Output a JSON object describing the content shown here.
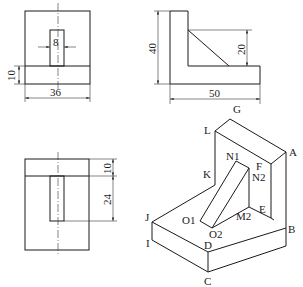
{
  "figure": {
    "front_view": {
      "dims": {
        "width": "36",
        "base_height": "10",
        "slot_width": "8"
      }
    },
    "side_view": {
      "dims": {
        "height": "40",
        "length": "50",
        "rib_height": "20"
      }
    },
    "top_view": {
      "dims": {
        "back_thickness": "10",
        "slot_length": "24"
      }
    },
    "isometric_view": {
      "vertex_labels": {
        "G": "G",
        "L": "L",
        "A": "A",
        "K": "K",
        "N1": "N1",
        "F": "F",
        "N2": "N2",
        "E": "E",
        "J": "J",
        "O1": "O1",
        "M2": "M2",
        "O2": "O2",
        "B": "B",
        "I": "I",
        "D": "D",
        "C": "C"
      }
    }
  }
}
